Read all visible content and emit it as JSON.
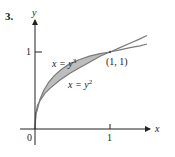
{
  "problem_number": "3.",
  "axes": {
    "x_label": "x",
    "y_label": "y",
    "origin_label": "0",
    "x_tick_label": "1",
    "y_tick_label": "1"
  },
  "curves": [
    {
      "label": "x = y",
      "exponent": "3",
      "equation": "x = y^3"
    },
    {
      "label": "x = y",
      "exponent": "2",
      "equation": "x = y^2"
    }
  ],
  "intersection_label": "(1, 1)",
  "colors": {
    "axis": "#222222",
    "curve": "#7a7a7a",
    "shaded_region": "#bdbdbd"
  }
}
